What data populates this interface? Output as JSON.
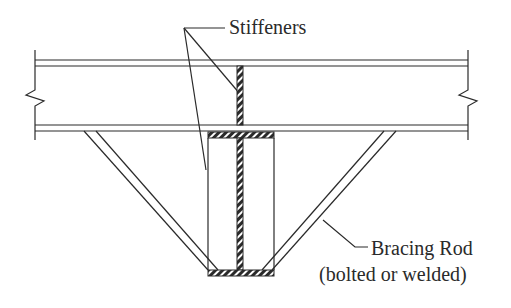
{
  "diagram": {
    "type": "structural-detail",
    "labels": {
      "stiffeners": "Stiffeners",
      "bracing_rod": "Bracing Rod",
      "bracing_rod_note": "(bolted or welded)"
    },
    "components": [
      {
        "name": "beam",
        "kind": "wide-flange beam elevation with break lines at both ends"
      },
      {
        "name": "web-stiffener",
        "kind": "hatched vertical plate inside beam web"
      },
      {
        "name": "bottom-tee",
        "kind": "hatched T-section below beam (top flange, web, bottom plate)"
      },
      {
        "name": "side-stiffener-plates",
        "kind": "vertical plate outlines beside tee web"
      },
      {
        "name": "left-bracing-rod",
        "kind": "diagonal double-line rod"
      },
      {
        "name": "right-bracing-rod",
        "kind": "diagonal double-line rod"
      }
    ],
    "colors": {
      "line": "#2a2a2a",
      "background": "#ffffff"
    }
  }
}
